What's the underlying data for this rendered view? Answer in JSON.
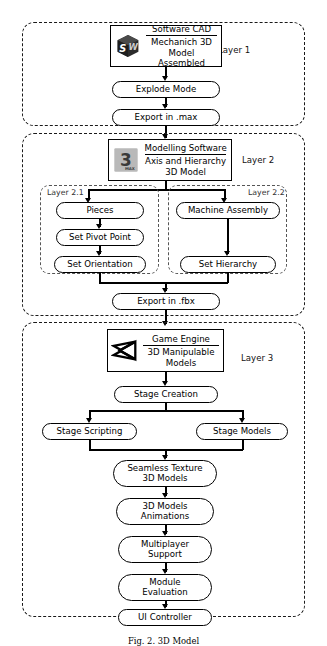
{
  "diagram": {
    "caption": "Fig. 2. 3D Model",
    "layers": [
      {
        "id": "layer1",
        "label": "Layer 1",
        "app": {
          "icon": "solidworks-icon",
          "title": "Software CAD",
          "subtitle_lines": [
            "Mechanich 3D",
            "Model Assembled"
          ]
        },
        "steps": [
          "Explode Mode",
          "Export in .max"
        ]
      },
      {
        "id": "layer2",
        "label": "Layer 2",
        "app": {
          "icon": "3dsmax-icon",
          "title": "Modelling Software",
          "subtitle_lines": [
            "Axis and Hierarchy",
            "3D Model"
          ]
        },
        "sublayers": [
          {
            "id": "layer2-1",
            "label": "Layer 2.1",
            "steps": [
              "Pieces",
              "Set Pivot Point",
              "Set Orientation"
            ]
          },
          {
            "id": "layer2-2",
            "label": "Layer 2.2",
            "steps": [
              "Machine Assembly",
              "Set Hierarchy"
            ]
          }
        ],
        "steps": [
          "Export in .fbx"
        ]
      },
      {
        "id": "layer3",
        "label": "Layer 3",
        "app": {
          "icon": "unity-icon",
          "title": "Game Engine",
          "subtitle_lines": [
            "3D Manipulable",
            "Models"
          ]
        },
        "steps_top": [
          "Stage Creation"
        ],
        "branch": [
          "Stage Scripting",
          "Stage Models"
        ],
        "steps_bottom": [
          "Seamless Texture\n3D Models",
          "3D Models\nAnimations",
          "Multiplayer\nSupport",
          "Module\nEvaluation",
          "UI Controller"
        ]
      }
    ],
    "icon_text": {
      "max_numeral": "3",
      "max_word": "MAX",
      "sw_left": "S",
      "sw_right": "W"
    },
    "colors": {
      "stroke": "#000000",
      "dashed_layer": "#1a1a1a",
      "dashed_sublayer": "#555555",
      "background": "#ffffff",
      "max_icon_bg": "#b9b9b9",
      "sw_icon_dark": "#2b2b2b"
    }
  }
}
